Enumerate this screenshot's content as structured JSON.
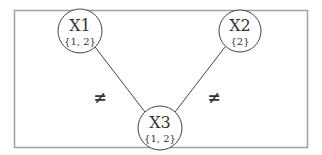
{
  "diagram": {
    "type": "constraint-graph",
    "colors": {
      "stroke": "#444444",
      "frame": "#9a9a9a",
      "text": "#333333"
    },
    "nodes": [
      {
        "id": "X1",
        "name": "X1",
        "domain": "{1, 2}",
        "cx": 80,
        "cy": 31
      },
      {
        "id": "X2",
        "name": "X2",
        "domain": "{2}",
        "cx": 240,
        "cy": 31
      },
      {
        "id": "X3",
        "name": "X3",
        "domain": "{1, 2}",
        "cx": 160,
        "cy": 128
      }
    ],
    "edges": [
      {
        "from": "X1",
        "to": "X3",
        "label": "≠"
      },
      {
        "from": "X2",
        "to": "X3",
        "label": "≠"
      }
    ]
  }
}
